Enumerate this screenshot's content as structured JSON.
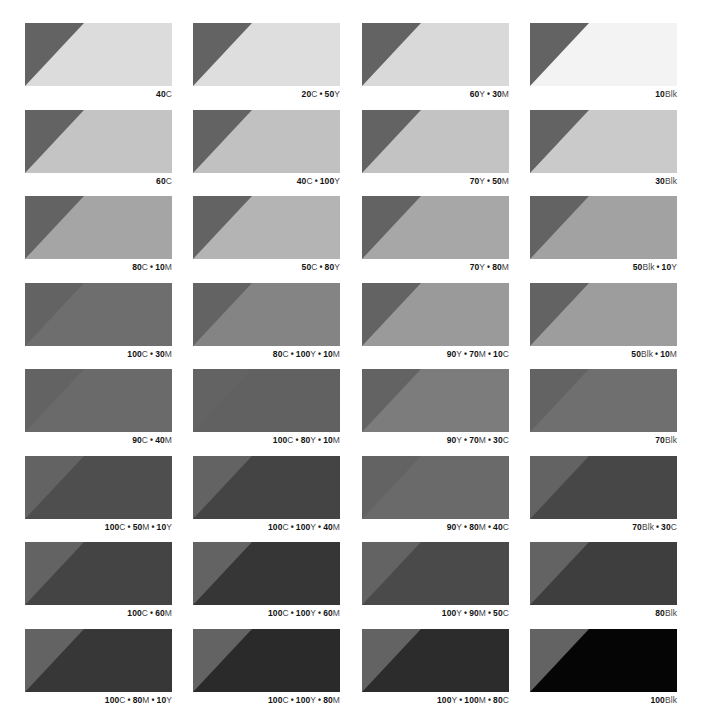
{
  "page": {
    "triangle_color": "#636363",
    "background": "#ffffff"
  },
  "swatches": [
    {
      "row": 0,
      "col": 0,
      "parts": [
        {
          "n": "40",
          "u": "C"
        }
      ],
      "label": "40C",
      "fill": "#dcdcdc"
    },
    {
      "row": 0,
      "col": 1,
      "parts": [
        {
          "n": "20",
          "u": "C"
        },
        {
          "n": "50",
          "u": "Y"
        }
      ],
      "label": "20C • 50Y",
      "fill": "#dedede"
    },
    {
      "row": 0,
      "col": 2,
      "parts": [
        {
          "n": "60",
          "u": "Y"
        },
        {
          "n": "30",
          "u": "M"
        }
      ],
      "label": "60Y • 30M",
      "fill": "#d9d9d9"
    },
    {
      "row": 0,
      "col": 3,
      "parts": [
        {
          "n": "10",
          "u": "Blk"
        }
      ],
      "label": "10Blk",
      "fill": "#f3f3f3"
    },
    {
      "row": 1,
      "col": 0,
      "parts": [
        {
          "n": "60",
          "u": "C"
        }
      ],
      "label": "60C",
      "fill": "#c4c4c4"
    },
    {
      "row": 1,
      "col": 1,
      "parts": [
        {
          "n": "40",
          "u": "C"
        },
        {
          "n": "100",
          "u": "Y"
        }
      ],
      "label": "40C • 100Y",
      "fill": "#c1c1c1"
    },
    {
      "row": 1,
      "col": 2,
      "parts": [
        {
          "n": "70",
          "u": "Y"
        },
        {
          "n": "50",
          "u": "M"
        }
      ],
      "label": "70Y • 50M",
      "fill": "#c3c3c3"
    },
    {
      "row": 1,
      "col": 3,
      "parts": [
        {
          "n": "30",
          "u": "Blk"
        }
      ],
      "label": "30Blk",
      "fill": "#cacaca"
    },
    {
      "row": 2,
      "col": 0,
      "parts": [
        {
          "n": "80",
          "u": "C"
        },
        {
          "n": "10",
          "u": "M"
        }
      ],
      "label": "80C • 10M",
      "fill": "#a5a5a5"
    },
    {
      "row": 2,
      "col": 1,
      "parts": [
        {
          "n": "50",
          "u": "C"
        },
        {
          "n": "80",
          "u": "Y"
        }
      ],
      "label": "50C • 80Y",
      "fill": "#b4b4b4"
    },
    {
      "row": 2,
      "col": 2,
      "parts": [
        {
          "n": "70",
          "u": "Y"
        },
        {
          "n": "80",
          "u": "M"
        }
      ],
      "label": "70Y • 80M",
      "fill": "#a7a7a7"
    },
    {
      "row": 2,
      "col": 3,
      "parts": [
        {
          "n": "50",
          "u": "Blk"
        },
        {
          "n": "10",
          "u": "Y"
        }
      ],
      "label": "50Blk • 10Y",
      "fill": "#a2a2a2"
    },
    {
      "row": 3,
      "col": 0,
      "parts": [
        {
          "n": "100",
          "u": "C"
        },
        {
          "n": "30",
          "u": "M"
        }
      ],
      "label": "100C • 30M",
      "fill": "#6e6e6e"
    },
    {
      "row": 3,
      "col": 1,
      "parts": [
        {
          "n": "80",
          "u": "C"
        },
        {
          "n": "100",
          "u": "Y"
        },
        {
          "n": "10",
          "u": "M"
        }
      ],
      "label": "80C • 100Y • 10M",
      "fill": "#848484"
    },
    {
      "row": 3,
      "col": 2,
      "parts": [
        {
          "n": "90",
          "u": "Y"
        },
        {
          "n": "70",
          "u": "M"
        },
        {
          "n": "10",
          "u": "C"
        }
      ],
      "label": "90Y • 70M • 10C",
      "fill": "#9a9a9a"
    },
    {
      "row": 3,
      "col": 3,
      "parts": [
        {
          "n": "50",
          "u": "Blk"
        },
        {
          "n": "10",
          "u": "M"
        }
      ],
      "label": "50Blk • 10M",
      "fill": "#9d9d9d"
    },
    {
      "row": 4,
      "col": 0,
      "parts": [
        {
          "n": "90",
          "u": "C"
        },
        {
          "n": "40",
          "u": "M"
        }
      ],
      "label": "90C • 40M",
      "fill": "#6a6a6a"
    },
    {
      "row": 4,
      "col": 1,
      "parts": [
        {
          "n": "100",
          "u": "C"
        },
        {
          "n": "80",
          "u": "Y"
        },
        {
          "n": "10",
          "u": "M"
        }
      ],
      "label": "100C • 80Y • 10M",
      "fill": "#616161"
    },
    {
      "row": 4,
      "col": 2,
      "parts": [
        {
          "n": "90",
          "u": "Y"
        },
        {
          "n": "70",
          "u": "M"
        },
        {
          "n": "30",
          "u": "C"
        }
      ],
      "label": "90Y • 70M • 30C",
      "fill": "#7c7c7c"
    },
    {
      "row": 4,
      "col": 3,
      "parts": [
        {
          "n": "70",
          "u": "Blk"
        }
      ],
      "label": "70Blk",
      "fill": "#6f6f6f"
    },
    {
      "row": 5,
      "col": 0,
      "parts": [
        {
          "n": "100",
          "u": "C"
        },
        {
          "n": "50",
          "u": "M"
        },
        {
          "n": "10",
          "u": "Y"
        }
      ],
      "label": "100C • 50M • 10Y",
      "fill": "#4e4e4e"
    },
    {
      "row": 5,
      "col": 1,
      "parts": [
        {
          "n": "100",
          "u": "C"
        },
        {
          "n": "100",
          "u": "Y"
        },
        {
          "n": "40",
          "u": "M"
        }
      ],
      "label": "100C • 100Y • 40M",
      "fill": "#444444"
    },
    {
      "row": 5,
      "col": 2,
      "parts": [
        {
          "n": "90",
          "u": "Y"
        },
        {
          "n": "80",
          "u": "M"
        },
        {
          "n": "40",
          "u": "C"
        }
      ],
      "label": "90Y • 80M • 40C",
      "fill": "#6a6a6a"
    },
    {
      "row": 5,
      "col": 3,
      "parts": [
        {
          "n": "70",
          "u": "Blk"
        },
        {
          "n": "30",
          "u": "C"
        }
      ],
      "label": "70Blk • 30C",
      "fill": "#474747"
    },
    {
      "row": 6,
      "col": 0,
      "parts": [
        {
          "n": "100",
          "u": "C"
        },
        {
          "n": "60",
          "u": "M"
        }
      ],
      "label": "100C • 60M",
      "fill": "#444444"
    },
    {
      "row": 6,
      "col": 1,
      "parts": [
        {
          "n": "100",
          "u": "C"
        },
        {
          "n": "100",
          "u": "Y"
        },
        {
          "n": "60",
          "u": "M"
        }
      ],
      "label": "100C • 100Y • 60M",
      "fill": "#363636"
    },
    {
      "row": 6,
      "col": 2,
      "parts": [
        {
          "n": "100",
          "u": "Y"
        },
        {
          "n": "90",
          "u": "M"
        },
        {
          "n": "50",
          "u": "C"
        }
      ],
      "label": "100Y • 90M • 50C",
      "fill": "#4a4a4a"
    },
    {
      "row": 6,
      "col": 3,
      "parts": [
        {
          "n": "80",
          "u": "Blk"
        }
      ],
      "label": "80Blk",
      "fill": "#3e3e3e"
    },
    {
      "row": 7,
      "col": 0,
      "parts": [
        {
          "n": "100",
          "u": "C"
        },
        {
          "n": "80",
          "u": "M"
        },
        {
          "n": "10",
          "u": "Y"
        }
      ],
      "label": "100C • 80M • 10Y",
      "fill": "#373737"
    },
    {
      "row": 7,
      "col": 1,
      "parts": [
        {
          "n": "100",
          "u": "C"
        },
        {
          "n": "100",
          "u": "Y"
        },
        {
          "n": "80",
          "u": "M"
        }
      ],
      "label": "100C • 100Y • 80M",
      "fill": "#2a2a2a"
    },
    {
      "row": 7,
      "col": 2,
      "parts": [
        {
          "n": "100",
          "u": "Y"
        },
        {
          "n": "100",
          "u": "M"
        },
        {
          "n": "80",
          "u": "C"
        }
      ],
      "label": "100Y • 100M • 80C",
      "fill": "#2c2c2c"
    },
    {
      "row": 7,
      "col": 3,
      "parts": [
        {
          "n": "100",
          "u": "Blk"
        }
      ],
      "label": "100Blk",
      "fill": "#050505"
    }
  ],
  "layout": {
    "col_x": [
      25,
      193,
      362,
      530
    ],
    "row_y": [
      23,
      110,
      196,
      283,
      369,
      456,
      542,
      629
    ]
  }
}
